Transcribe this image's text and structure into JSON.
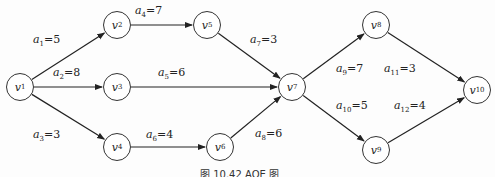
{
  "caption": "图 10.42 AOE 图",
  "nodes": [
    {
      "id": "v1",
      "name": "v",
      "sub": "1",
      "x": 20,
      "y": 87
    },
    {
      "id": "v2",
      "name": "v",
      "sub": "2",
      "x": 117,
      "y": 25
    },
    {
      "id": "v3",
      "name": "v",
      "sub": "3",
      "x": 117,
      "y": 87
    },
    {
      "id": "v4",
      "name": "v",
      "sub": "4",
      "x": 117,
      "y": 147
    },
    {
      "id": "v5",
      "name": "v",
      "sub": "5",
      "x": 207,
      "y": 25
    },
    {
      "id": "v6",
      "name": "v",
      "sub": "6",
      "x": 220,
      "y": 147
    },
    {
      "id": "v7",
      "name": "v",
      "sub": "7",
      "x": 292,
      "y": 87
    },
    {
      "id": "v8",
      "name": "v",
      "sub": "8",
      "x": 376,
      "y": 25
    },
    {
      "id": "v9",
      "name": "v",
      "sub": "9",
      "x": 376,
      "y": 150
    },
    {
      "id": "v10",
      "name": "v",
      "sub": "10",
      "x": 477,
      "y": 90
    }
  ],
  "edges": [
    {
      "from": "v1",
      "to": "v2",
      "name": "a",
      "sub": "1",
      "weight": "5",
      "lx": 33,
      "ly": 33
    },
    {
      "from": "v1",
      "to": "v3",
      "name": "a",
      "sub": "2",
      "weight": "8",
      "lx": 53,
      "ly": 66
    },
    {
      "from": "v1",
      "to": "v4",
      "name": "a",
      "sub": "3",
      "weight": "3",
      "lx": 33,
      "ly": 128
    },
    {
      "from": "v2",
      "to": "v5",
      "name": "a",
      "sub": "4",
      "weight": "7",
      "lx": 135,
      "ly": 4
    },
    {
      "from": "v3",
      "to": "v7",
      "name": "a",
      "sub": "5",
      "weight": "6",
      "lx": 158,
      "ly": 66
    },
    {
      "from": "v4",
      "to": "v6",
      "name": "a",
      "sub": "6",
      "weight": "4",
      "lx": 146,
      "ly": 128
    },
    {
      "from": "v5",
      "to": "v7",
      "name": "a",
      "sub": "7",
      "weight": "3",
      "lx": 250,
      "ly": 33
    },
    {
      "from": "v6",
      "to": "v7",
      "name": "a",
      "sub": "8",
      "weight": "6",
      "lx": 255,
      "ly": 127
    },
    {
      "from": "v7",
      "to": "v8",
      "name": "a",
      "sub": "9",
      "weight": "7",
      "lx": 336,
      "ly": 62
    },
    {
      "from": "v7",
      "to": "v9",
      "name": "a",
      "sub": "10",
      "weight": "5",
      "lx": 336,
      "ly": 99
    },
    {
      "from": "v8",
      "to": "v10",
      "name": "a",
      "sub": "11",
      "weight": "3",
      "lx": 384,
      "ly": 62
    },
    {
      "from": "v9",
      "to": "v10",
      "name": "a",
      "sub": "12",
      "weight": "4",
      "lx": 394,
      "ly": 99
    }
  ]
}
